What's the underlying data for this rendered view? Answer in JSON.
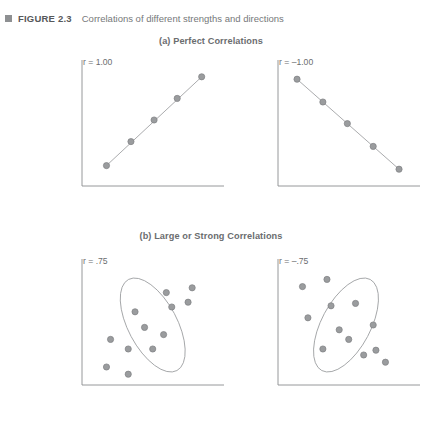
{
  "figure": {
    "marker_icon": "filled-square-icon",
    "number_label": "FIGURE 2.3",
    "title": "Correlations of different strengths and directions"
  },
  "sections": {
    "a": {
      "heading": "(a) Perfect Correlations"
    },
    "b": {
      "heading": "(b) Large or Strong Correlations"
    }
  },
  "colors": {
    "axis": "#8a8c8e",
    "point_fill": "#9a9c9e",
    "point_stroke": "#7e8082",
    "trend_line": "#a0a2a4",
    "ellipse": "#9a9c9e",
    "text": "#6b6d6f",
    "caption_bold": "#56585a"
  },
  "panels": {
    "a_left": {
      "r_label": "r = 1.00"
    },
    "a_right": {
      "r_label": "r = –1.00"
    },
    "b_left": {
      "r_label": "r = .75"
    },
    "b_right": {
      "r_label": "r = –.75"
    }
  },
  "chart_data": [
    {
      "id": "a_left",
      "type": "scatter",
      "title": "r = 1.00",
      "section": "(a) Perfect Correlations",
      "r": 1.0,
      "trend_line": true,
      "ellipse": false,
      "xlabel": "",
      "ylabel": "",
      "xlim": [
        0,
        100
      ],
      "ylim": [
        0,
        100
      ],
      "grid": false,
      "legend": "none",
      "points": [
        {
          "x": 18,
          "y": 17
        },
        {
          "x": 36,
          "y": 37
        },
        {
          "x": 53,
          "y": 55
        },
        {
          "x": 70,
          "y": 73
        },
        {
          "x": 88,
          "y": 91
        }
      ]
    },
    {
      "id": "a_right",
      "type": "scatter",
      "title": "r = –1.00",
      "section": "(a) Perfect Correlations",
      "r": -1.0,
      "trend_line": true,
      "ellipse": false,
      "xlabel": "",
      "ylabel": "",
      "xlim": [
        0,
        100
      ],
      "ylim": [
        0,
        100
      ],
      "grid": false,
      "legend": "none",
      "points": [
        {
          "x": 14,
          "y": 89
        },
        {
          "x": 33,
          "y": 70
        },
        {
          "x": 51,
          "y": 52
        },
        {
          "x": 70,
          "y": 33
        },
        {
          "x": 89,
          "y": 14
        }
      ]
    },
    {
      "id": "b_left",
      "type": "scatter",
      "title": "r = .75",
      "section": "(b) Large or Strong Correlations",
      "r": 0.75,
      "trend_line": false,
      "ellipse": {
        "cx": 52,
        "cy": 50,
        "rx": 18,
        "ry": 43,
        "rotation_deg": -28
      },
      "xlabel": "",
      "ylabel": "",
      "xlim": [
        0,
        100
      ],
      "ylim": [
        0,
        100
      ],
      "grid": false,
      "legend": "none",
      "points": [
        {
          "x": 18,
          "y": 15
        },
        {
          "x": 34,
          "y": 9
        },
        {
          "x": 21,
          "y": 38
        },
        {
          "x": 34,
          "y": 30
        },
        {
          "x": 52,
          "y": 30
        },
        {
          "x": 46,
          "y": 48
        },
        {
          "x": 60,
          "y": 42
        },
        {
          "x": 39,
          "y": 61
        },
        {
          "x": 66,
          "y": 65
        },
        {
          "x": 62,
          "y": 77
        },
        {
          "x": 78,
          "y": 69
        },
        {
          "x": 81,
          "y": 81
        }
      ]
    },
    {
      "id": "b_right",
      "type": "scatter",
      "title": "r = –.75",
      "section": "(b) Large or Strong Correlations",
      "r": -0.75,
      "trend_line": false,
      "ellipse": {
        "cx": 50,
        "cy": 50,
        "rx": 18,
        "ry": 43,
        "rotation_deg": 28
      },
      "xlabel": "",
      "ylabel": "",
      "xlim": [
        0,
        100
      ],
      "ylim": [
        0,
        100
      ],
      "grid": false,
      "legend": "none",
      "points": [
        {
          "x": 18,
          "y": 82
        },
        {
          "x": 36,
          "y": 88
        },
        {
          "x": 22,
          "y": 56
        },
        {
          "x": 39,
          "y": 66
        },
        {
          "x": 57,
          "y": 68
        },
        {
          "x": 45,
          "y": 46
        },
        {
          "x": 52,
          "y": 38
        },
        {
          "x": 70,
          "y": 50
        },
        {
          "x": 33,
          "y": 30
        },
        {
          "x": 63,
          "y": 25
        },
        {
          "x": 72,
          "y": 29
        },
        {
          "x": 79,
          "y": 19
        }
      ]
    }
  ]
}
